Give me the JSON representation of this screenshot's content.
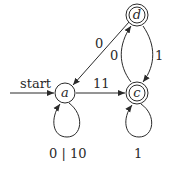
{
  "diagram": {
    "type": "finite-automaton",
    "start_label": "start",
    "states": [
      {
        "id": "a",
        "label": "a",
        "accepting": false,
        "initial": true
      },
      {
        "id": "c",
        "label": "c",
        "accepting": true,
        "initial": false
      },
      {
        "id": "d",
        "label": "d",
        "accepting": true,
        "initial": false
      }
    ],
    "transitions": [
      {
        "from": "a",
        "to": "a",
        "label": "0 | 10"
      },
      {
        "from": "a",
        "to": "c",
        "label": "11"
      },
      {
        "from": "d",
        "to": "a",
        "label": "0"
      },
      {
        "from": "c",
        "to": "d",
        "label": "0"
      },
      {
        "from": "d",
        "to": "c",
        "label": "1"
      },
      {
        "from": "c",
        "to": "c",
        "label": "1"
      }
    ],
    "colors": {
      "stroke": "#2a2a2a",
      "background": "#ffffff"
    }
  }
}
